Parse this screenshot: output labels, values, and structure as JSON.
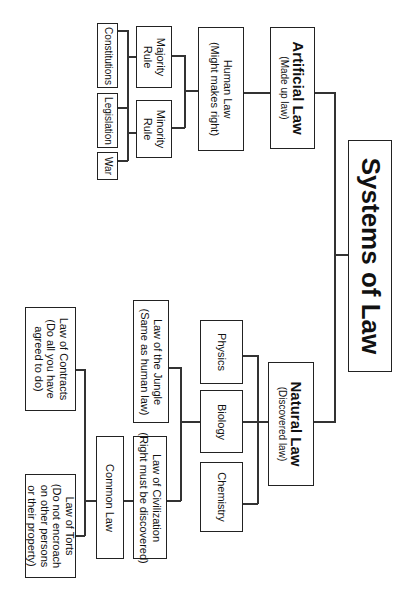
{
  "diagram": {
    "root": {
      "label": "Systems of Law"
    },
    "artificial": {
      "title": "Artificial Law",
      "subtitle": "(Made up law)"
    },
    "human": {
      "title": "Human Law",
      "subtitle": "(Might makes right)"
    },
    "majority": {
      "label": "Majority Rule"
    },
    "minority": {
      "label": "Minority Rule"
    },
    "constitutions": {
      "label": "Constitutions"
    },
    "legislation": {
      "label": "Legislation"
    },
    "war": {
      "label": "War"
    },
    "natural": {
      "title": "Natural Law",
      "subtitle": "(Discovered law)"
    },
    "physics": {
      "label": "Physics"
    },
    "biology": {
      "label": "Biology"
    },
    "chemistry": {
      "label": "Chemistry"
    },
    "jungle": {
      "title": "Law of the Jungle",
      "subtitle": "(Same as human law)"
    },
    "civilization": {
      "title": "Law of Civilization",
      "subtitle": "(Right must be discovered)"
    },
    "common": {
      "label": "Common Law"
    },
    "contracts": {
      "title": "Law of Contracts",
      "subtitle": "(Do all you have agreed to do)"
    },
    "torts": {
      "title": "Law of Torts",
      "subtitle": "(Do not encroach on other persons or their property)"
    }
  }
}
